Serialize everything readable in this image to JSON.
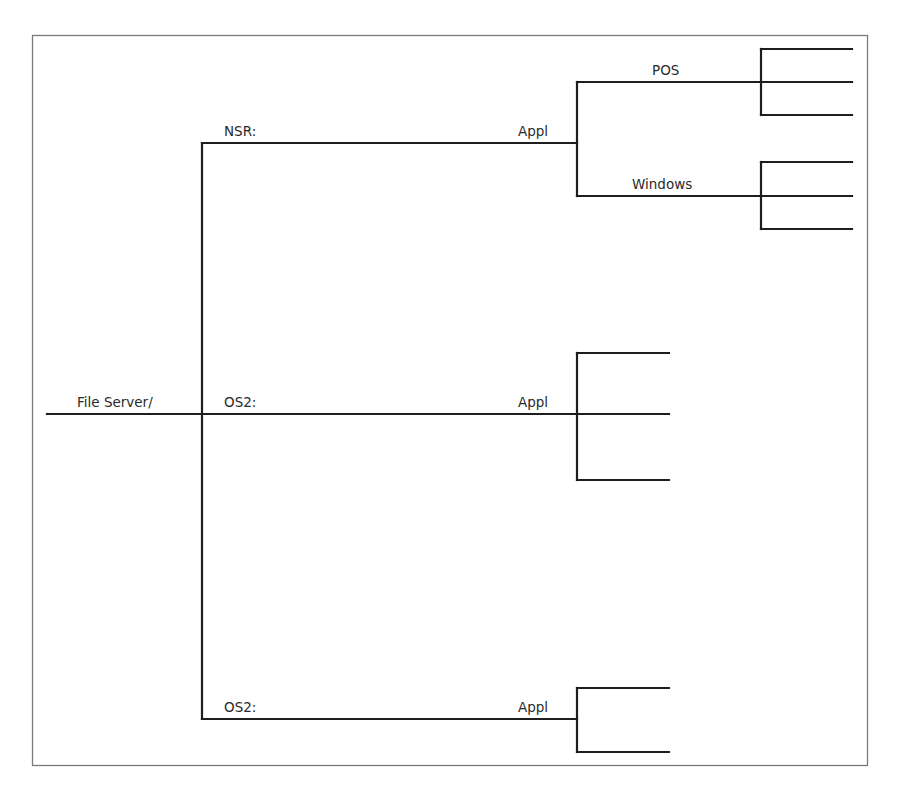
{
  "diagram": {
    "type": "network-tree",
    "root": {
      "label": "File Server/",
      "children": [
        {
          "label": "NSR:",
          "node_label": "Appl",
          "children": [
            {
              "label": "POS",
              "leaf_count": 3
            },
            {
              "label": "Windows",
              "leaf_count": 3
            }
          ]
        },
        {
          "label": "OS2:",
          "node_label": "Appl",
          "leaf_count": 3
        },
        {
          "label": "OS2:",
          "node_label": "Appl",
          "leaf_count": 2
        }
      ]
    },
    "labels": {
      "root": "File Server/",
      "branch_nsr": "NSR:",
      "branch_os2_a": "OS2:",
      "branch_os2_b": "OS2:",
      "appl_nsr": "Appl",
      "appl_os2_a": "Appl",
      "appl_os2_b": "Appl",
      "pos": "POS",
      "windows": "Windows"
    },
    "colors": {
      "line": "#1e1e1e",
      "frame": "#7a7a7a",
      "text": "#2a2a2a",
      "background": "#ffffff"
    }
  }
}
